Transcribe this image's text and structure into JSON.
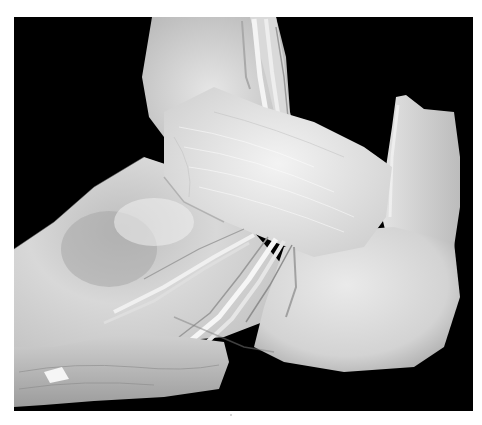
{
  "figure": {
    "background_color": "#000000",
    "frame_color": "#ffffff",
    "palette": {
      "tissue_light": "#ebebeb",
      "tissue_mid": "#cfcfcf",
      "tissue_shadow": "#a6a6a6",
      "tissue_dark": "#7a7a7a",
      "tendon": "#f2f2f2"
    }
  }
}
